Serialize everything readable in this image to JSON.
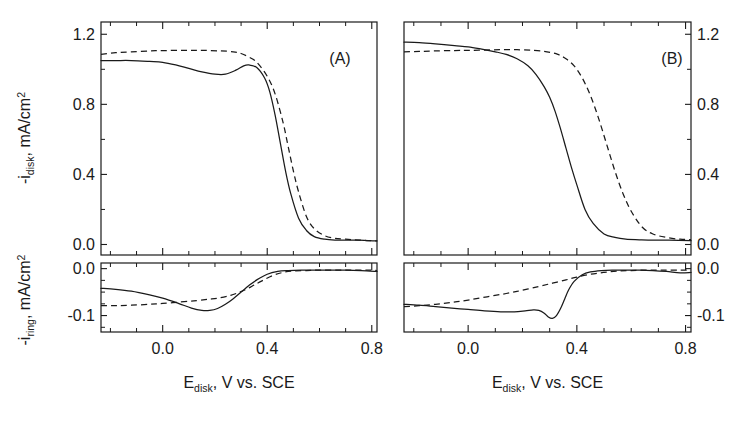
{
  "figure": {
    "panels": [
      "(A)",
      "(B)"
    ],
    "x_axis": {
      "title_main": "E",
      "title_sub": "disk",
      "title_rest": ", V vs. SCE",
      "ticks": [
        "0.0",
        "0.4",
        "0.8"
      ],
      "tick_values": [
        0.0,
        0.4,
        0.8
      ],
      "range": [
        -0.236,
        0.82
      ],
      "minor_step": 0.1
    },
    "y_axis_disk": {
      "title_pre": "-i",
      "title_sub": "disk",
      "title_rest": ", mA/cm",
      "title_sup": "2",
      "ticks": [
        "1.2",
        "0.8",
        "0.4",
        "0.0"
      ],
      "tick_values": [
        1.2,
        0.8,
        0.4,
        0.0
      ],
      "range": [
        -0.06,
        1.27
      ],
      "minor_step": 0.2
    },
    "y_axis_ring": {
      "title_pre": "-i",
      "title_sub": "ring",
      "title_rest": ", mA/cm",
      "title_sup": "2",
      "ticks": [
        "0.0",
        "-0.1"
      ],
      "tick_values": [
        0.0,
        -0.1
      ],
      "range": [
        -0.135,
        0.012
      ],
      "minor_step": 0.025
    },
    "colors": {
      "ink": "#1a1a1a",
      "background": "#ffffff"
    }
  },
  "chart_data": {
    "type": "line",
    "title": "",
    "xlabel": "E_disk, V vs. SCE",
    "ylabel": "-i_disk, mA/cm2 (top) ; -i_ring, mA/cm2 (bottom)",
    "grid": false,
    "legend": "none",
    "panels": [
      {
        "name": "(A)",
        "xlim": [
          -0.236,
          0.82
        ],
        "subplots": [
          {
            "name": "disk",
            "ylim": [
              -0.06,
              1.27
            ],
            "yticks": [
              0.0,
              0.4,
              0.8,
              1.2
            ],
            "series": [
              {
                "name": "solid",
                "style": "solid",
                "x": [
                  -0.236,
                  -0.18,
                  -0.12,
                  -0.05,
                  0.0,
                  0.05,
                  0.1,
                  0.15,
                  0.2,
                  0.24,
                  0.28,
                  0.31,
                  0.33,
                  0.36,
                  0.39,
                  0.41,
                  0.43,
                  0.45,
                  0.47,
                  0.49,
                  0.52,
                  0.55,
                  0.58,
                  0.62,
                  0.66,
                  0.7,
                  0.75,
                  0.82
                ],
                "y": [
                  1.05,
                  1.05,
                  1.05,
                  1.045,
                  1.04,
                  1.025,
                  1.005,
                  0.985,
                  0.972,
                  0.972,
                  0.995,
                  1.02,
                  1.025,
                  1.01,
                  0.95,
                  0.87,
                  0.74,
                  0.58,
                  0.42,
                  0.29,
                  0.15,
                  0.08,
                  0.045,
                  0.03,
                  0.025,
                  0.025,
                  0.025,
                  0.02
                ]
              },
              {
                "name": "dashed",
                "style": "dashed",
                "x": [
                  -0.236,
                  -0.18,
                  -0.12,
                  -0.05,
                  0.0,
                  0.08,
                  0.15,
                  0.22,
                  0.27,
                  0.3,
                  0.33,
                  0.36,
                  0.4,
                  0.43,
                  0.46,
                  0.48,
                  0.5,
                  0.52,
                  0.55,
                  0.58,
                  0.62,
                  0.66,
                  0.7,
                  0.75,
                  0.82
                ],
                "y": [
                  1.085,
                  1.095,
                  1.1,
                  1.105,
                  1.107,
                  1.108,
                  1.108,
                  1.105,
                  1.1,
                  1.09,
                  1.07,
                  1.04,
                  0.96,
                  0.86,
                  0.7,
                  0.56,
                  0.42,
                  0.3,
                  0.16,
                  0.09,
                  0.05,
                  0.035,
                  0.03,
                  0.025,
                  0.02
                ]
              }
            ]
          },
          {
            "name": "ring",
            "ylim": [
              -0.135,
              0.012
            ],
            "yticks": [
              0.0,
              -0.1
            ],
            "series": [
              {
                "name": "solid",
                "style": "solid",
                "x": [
                  -0.236,
                  -0.18,
                  -0.12,
                  -0.05,
                  0.0,
                  0.06,
                  0.11,
                  0.15,
                  0.18,
                  0.21,
                  0.24,
                  0.27,
                  0.3,
                  0.33,
                  0.36,
                  0.4,
                  0.44,
                  0.48,
                  0.53,
                  0.58,
                  0.64,
                  0.7,
                  0.76,
                  0.82
                ],
                "y": [
                  -0.042,
                  -0.044,
                  -0.048,
                  -0.056,
                  -0.063,
                  -0.074,
                  -0.084,
                  -0.089,
                  -0.089,
                  -0.085,
                  -0.076,
                  -0.064,
                  -0.05,
                  -0.036,
                  -0.024,
                  -0.012,
                  -0.006,
                  -0.004,
                  -0.003,
                  -0.003,
                  -0.003,
                  -0.003,
                  -0.004,
                  -0.006
                ]
              },
              {
                "name": "dashed",
                "style": "dashed",
                "x": [
                  -0.236,
                  -0.18,
                  -0.12,
                  -0.05,
                  0.0,
                  0.07,
                  0.13,
                  0.18,
                  0.22,
                  0.26,
                  0.29,
                  0.32,
                  0.35,
                  0.38,
                  0.42,
                  0.46,
                  0.5,
                  0.55,
                  0.6,
                  0.66,
                  0.72,
                  0.78,
                  0.82
                ],
                "y": [
                  -0.079,
                  -0.079,
                  -0.078,
                  -0.076,
                  -0.074,
                  -0.071,
                  -0.068,
                  -0.065,
                  -0.062,
                  -0.057,
                  -0.051,
                  -0.044,
                  -0.035,
                  -0.026,
                  -0.015,
                  -0.008,
                  -0.005,
                  -0.004,
                  -0.003,
                  -0.003,
                  -0.003,
                  -0.003,
                  -0.004
                ]
              }
            ]
          }
        ]
      },
      {
        "name": "(B)",
        "xlim": [
          -0.236,
          0.82
        ],
        "subplots": [
          {
            "name": "disk",
            "ylim": [
              -0.06,
              1.27
            ],
            "yticks": [
              0.0,
              0.4,
              0.8,
              1.2
            ],
            "series": [
              {
                "name": "solid",
                "style": "solid",
                "x": [
                  -0.236,
                  -0.18,
                  -0.12,
                  -0.05,
                  0.0,
                  0.05,
                  0.1,
                  0.14,
                  0.18,
                  0.22,
                  0.25,
                  0.28,
                  0.3,
                  0.32,
                  0.34,
                  0.36,
                  0.38,
                  0.4,
                  0.43,
                  0.46,
                  0.5,
                  0.54,
                  0.58,
                  0.63,
                  0.68,
                  0.74,
                  0.82
                ],
                "y": [
                  1.155,
                  1.152,
                  1.145,
                  1.135,
                  1.128,
                  1.115,
                  1.1,
                  1.085,
                  1.06,
                  1.02,
                  0.97,
                  0.9,
                  0.84,
                  0.76,
                  0.66,
                  0.55,
                  0.44,
                  0.34,
                  0.2,
                  0.12,
                  0.06,
                  0.04,
                  0.03,
                  0.027,
                  0.025,
                  0.025,
                  0.022
                ]
              },
              {
                "name": "dashed",
                "style": "dashed",
                "x": [
                  -0.236,
                  -0.18,
                  -0.12,
                  -0.05,
                  0.0,
                  0.06,
                  0.12,
                  0.18,
                  0.24,
                  0.29,
                  0.33,
                  0.36,
                  0.39,
                  0.42,
                  0.45,
                  0.48,
                  0.51,
                  0.54,
                  0.57,
                  0.6,
                  0.64,
                  0.68,
                  0.73,
                  0.78,
                  0.82
                ],
                "y": [
                  1.1,
                  1.102,
                  1.105,
                  1.107,
                  1.108,
                  1.11,
                  1.112,
                  1.112,
                  1.108,
                  1.1,
                  1.085,
                  1.06,
                  1.02,
                  0.95,
                  0.85,
                  0.72,
                  0.57,
                  0.42,
                  0.29,
                  0.19,
                  0.1,
                  0.06,
                  0.04,
                  0.03,
                  0.028
                ]
              }
            ]
          },
          {
            "name": "ring",
            "ylim": [
              -0.135,
              0.012
            ],
            "yticks": [
              0.0,
              -0.1
            ],
            "series": [
              {
                "name": "solid",
                "style": "solid",
                "x": [
                  -0.236,
                  -0.18,
                  -0.12,
                  -0.06,
                  0.0,
                  0.06,
                  0.12,
                  0.17,
                  0.21,
                  0.24,
                  0.26,
                  0.28,
                  0.295,
                  0.31,
                  0.325,
                  0.34,
                  0.355,
                  0.37,
                  0.39,
                  0.42,
                  0.45,
                  0.49,
                  0.53,
                  0.58,
                  0.63,
                  0.68,
                  0.73,
                  0.78,
                  0.82
                ],
                "y": [
                  -0.076,
                  -0.078,
                  -0.081,
                  -0.084,
                  -0.087,
                  -0.09,
                  -0.092,
                  -0.092,
                  -0.09,
                  -0.088,
                  -0.089,
                  -0.095,
                  -0.103,
                  -0.106,
                  -0.1,
                  -0.085,
                  -0.065,
                  -0.045,
                  -0.027,
                  -0.013,
                  -0.007,
                  -0.004,
                  -0.003,
                  -0.003,
                  -0.003,
                  -0.004,
                  -0.006,
                  -0.009,
                  -0.008
                ]
              },
              {
                "name": "dashed",
                "style": "dashed",
                "x": [
                  -0.236,
                  -0.18,
                  -0.12,
                  -0.06,
                  0.0,
                  0.07,
                  0.14,
                  0.2,
                  0.26,
                  0.31,
                  0.36,
                  0.4,
                  0.45,
                  0.5,
                  0.55,
                  0.6,
                  0.66,
                  0.72,
                  0.78,
                  0.82
                ],
                "y": [
                  -0.081,
                  -0.079,
                  -0.076,
                  -0.072,
                  -0.067,
                  -0.06,
                  -0.053,
                  -0.046,
                  -0.038,
                  -0.031,
                  -0.024,
                  -0.018,
                  -0.012,
                  -0.008,
                  -0.005,
                  -0.004,
                  -0.003,
                  -0.003,
                  -0.003,
                  -0.003
                ]
              }
            ]
          }
        ]
      }
    ]
  }
}
